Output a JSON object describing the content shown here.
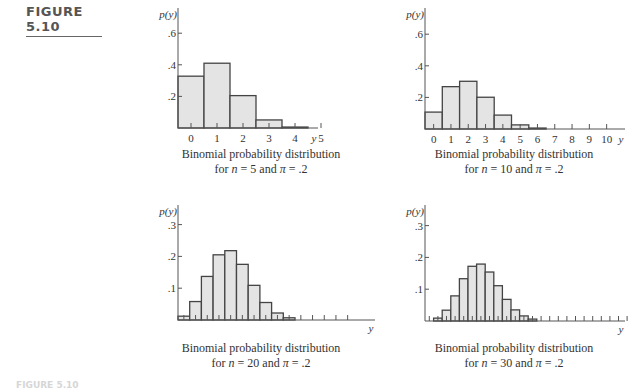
{
  "figure_label": "FIGURE 5.10",
  "footer_label": "FIGURE 5.10",
  "colors": {
    "bar_fill": "#e4e4e4",
    "bar_stroke": "#444444",
    "axis": "#555555"
  },
  "panels": [
    {
      "caption_line1": "Binomial probability distribution",
      "caption_n": "5",
      "caption_pi": ".2"
    },
    {
      "caption_line1": "Binomial probability distribution",
      "caption_n": "10",
      "caption_pi": ".2"
    },
    {
      "caption_line1": "Binomial probability distribution",
      "caption_n": "20",
      "caption_pi": ".2"
    },
    {
      "caption_line1": "Binomial probability distribution",
      "caption_n": "30",
      "caption_pi": ".2"
    }
  ],
  "chart_data": [
    {
      "type": "bar",
      "title": "Binomial probability distribution for n = 5 and π = .2",
      "xlabel": "y",
      "ylabel": "p(y)",
      "categories": [
        0,
        1,
        2,
        3,
        4,
        5
      ],
      "values": [
        0.328,
        0.41,
        0.205,
        0.051,
        0.006,
        0.0003
      ],
      "x_tick_labels": [
        "0",
        "1",
        "2",
        "3",
        "4",
        "5"
      ],
      "y_ticks": [
        ".2",
        ".4",
        ".6"
      ],
      "ylim": [
        0,
        0.7
      ],
      "grid": false
    },
    {
      "type": "bar",
      "title": "Binomial probability distribution for n = 10 and π = .2",
      "xlabel": "y",
      "ylabel": "p(y)",
      "categories": [
        0,
        1,
        2,
        3,
        4,
        5,
        6,
        7,
        8,
        9,
        10
      ],
      "values": [
        0.107,
        0.268,
        0.302,
        0.201,
        0.088,
        0.026,
        0.006,
        0.001,
        0.0001,
        0,
        0
      ],
      "x_tick_labels": [
        "0",
        "1",
        "2",
        "3",
        "4",
        "5",
        "6",
        "7",
        "8",
        "9",
        "10"
      ],
      "y_ticks": [
        ".2",
        ".4",
        ".6"
      ],
      "ylim": [
        0,
        0.7
      ],
      "grid": false
    },
    {
      "type": "bar",
      "title": "Binomial probability distribution for n = 20 and π = .2",
      "xlabel": "y",
      "ylabel": "p(y)",
      "categories": [
        0,
        1,
        2,
        3,
        4,
        5,
        6,
        7,
        8,
        9,
        10,
        11,
        12,
        13,
        14
      ],
      "values": [
        0.012,
        0.058,
        0.137,
        0.205,
        0.218,
        0.175,
        0.109,
        0.055,
        0.022,
        0.007,
        0.002,
        0,
        0,
        0,
        0
      ],
      "x_tick_labels": [],
      "y_ticks": [
        ".1",
        ".2",
        ".3"
      ],
      "ylim": [
        0,
        0.33
      ],
      "grid": false
    },
    {
      "type": "bar",
      "title": "Binomial probability distribution for n = 30 and π = .2",
      "xlabel": "y",
      "ylabel": "p(y)",
      "categories": [
        0,
        1,
        2,
        3,
        4,
        5,
        6,
        7,
        8,
        9,
        10,
        11,
        12,
        13,
        14,
        15,
        16,
        17,
        18,
        19,
        20,
        21,
        22,
        23
      ],
      "values": [
        0.001,
        0.009,
        0.034,
        0.079,
        0.133,
        0.172,
        0.179,
        0.154,
        0.111,
        0.068,
        0.035,
        0.016,
        0.006,
        0.002,
        0.001,
        0,
        0,
        0,
        0,
        0,
        0,
        0,
        0,
        0
      ],
      "x_tick_labels": [],
      "y_ticks": [
        ".1",
        ".2",
        ".3"
      ],
      "ylim": [
        0,
        0.33
      ],
      "grid": false
    }
  ]
}
